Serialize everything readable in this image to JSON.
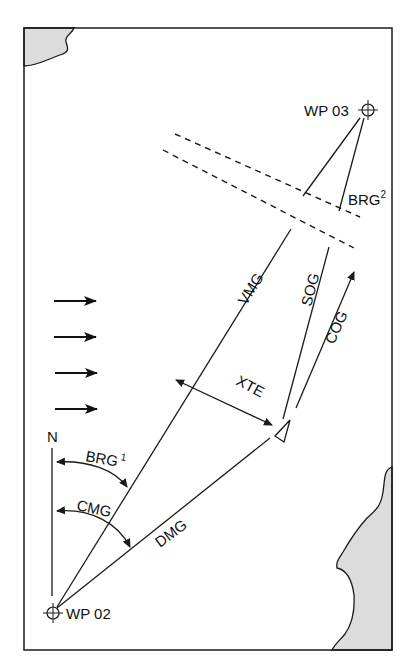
{
  "diagram": {
    "title": "",
    "colors": {
      "line": "#1a1a1a",
      "land": "#dcdcdc",
      "background": "#ffffff"
    },
    "waypoints": {
      "start": {
        "label": "WP 02",
        "icon": "crosshair-icon"
      },
      "end": {
        "label": "WP 03",
        "icon": "crosshair-icon"
      }
    },
    "north_label": "N",
    "labels": {
      "brg1": "BRG",
      "brg1_sup": "1",
      "brg2": "BRG",
      "brg2_sup": "2",
      "cmg": "CMG",
      "dmg": "DMG",
      "vmg": "VMG",
      "sog": "SOG",
      "cog": "COG",
      "xte": "XTE"
    },
    "wind_arrows_count": 4,
    "features": [
      "coastline-top-left",
      "coastline-bottom-right",
      "dashed-corridor",
      "boat-triangle"
    ]
  }
}
